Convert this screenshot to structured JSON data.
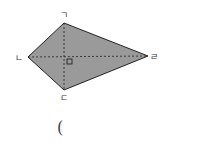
{
  "figure": {
    "shape": "kite",
    "fill_color": "#9a9a9a",
    "stroke_color": "#222222",
    "vertices": {
      "top": {
        "label": "ㄱ",
        "x": 64,
        "y": 23
      },
      "left": {
        "label": "ㄴ",
        "x": 28,
        "y": 57
      },
      "bottom": {
        "label": "ㄷ",
        "x": 64,
        "y": 90
      },
      "right": {
        "label": "ㄹ",
        "x": 148,
        "y": 56
      }
    },
    "diagonals": "dashed",
    "right_angle_marker": true
  },
  "answer": {
    "open_paren": "("
  }
}
